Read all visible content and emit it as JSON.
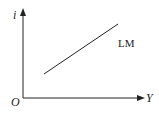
{
  "diagram": {
    "type": "economics-curve",
    "axes": {
      "y_label": "i",
      "x_label": "Y",
      "origin_label": "O"
    },
    "curves": [
      {
        "name": "LM",
        "label": "LM",
        "slope": "upward"
      }
    ],
    "colors": {
      "line": "#222222",
      "background": "#ffffff"
    }
  }
}
